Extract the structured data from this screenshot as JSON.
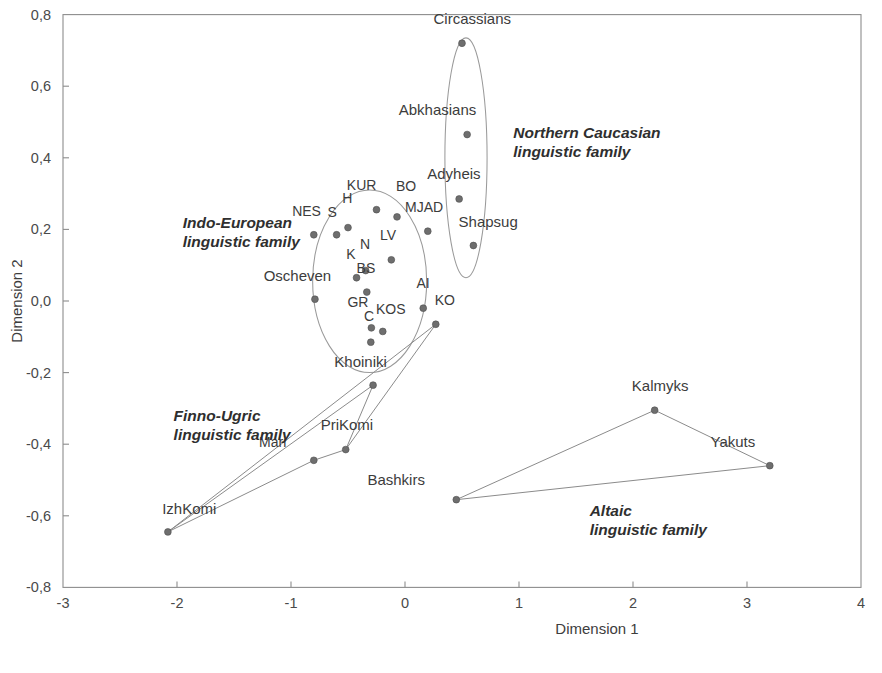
{
  "chart_data": {
    "type": "scatter",
    "title": "",
    "xlabel": "Dimension 1",
    "ylabel": "Dimension 2",
    "xlim": [
      -3,
      4
    ],
    "ylim": [
      -0.8,
      0.8
    ],
    "xticks": [
      "-3",
      "-2",
      "-1",
      "0",
      "1",
      "2",
      "3",
      "4"
    ],
    "xtick_values": [
      -3,
      -2,
      -1,
      0,
      1,
      2,
      3,
      4
    ],
    "yticks": [
      "0,8",
      "0,6",
      "0,4",
      "0,2",
      "0,0",
      "-0,2",
      "-0,4",
      "-0,6",
      "-0,8"
    ],
    "ytick_values": [
      0.8,
      0.6,
      0.4,
      0.2,
      0.0,
      -0.2,
      -0.4,
      -0.6,
      -0.8
    ],
    "grid": false,
    "legend": "none",
    "decimal_separator": "comma",
    "points": [
      {
        "label": "Circassians",
        "x": 0.5,
        "y": 0.72,
        "lx": -0.25,
        "ly": 0.055,
        "anchor": "start"
      },
      {
        "label": "Abkhasians",
        "x": 0.545,
        "y": 0.465,
        "lx": -0.6,
        "ly": 0.055,
        "anchor": "start"
      },
      {
        "label": "Adyheis",
        "x": 0.475,
        "y": 0.285,
        "lx": -0.28,
        "ly": 0.055,
        "anchor": "start"
      },
      {
        "label": "Shapsug",
        "x": 0.6,
        "y": 0.155,
        "lx": -0.13,
        "ly": 0.052,
        "anchor": "start"
      },
      {
        "label": "KUR",
        "x": -0.25,
        "y": 0.255,
        "lx": -0.26,
        "ly": 0.055,
        "anchor": "start"
      },
      {
        "label": "BO",
        "x": -0.07,
        "y": 0.235,
        "lx": -0.01,
        "ly": 0.072,
        "anchor": "start"
      },
      {
        "label": "MJAD",
        "x": 0.2,
        "y": 0.195,
        "lx": -0.2,
        "ly": 0.055,
        "anchor": "start"
      },
      {
        "label": "NES",
        "x": -0.8,
        "y": 0.185,
        "lx": -0.19,
        "ly": 0.052,
        "anchor": "start"
      },
      {
        "label": "S",
        "x": -0.6,
        "y": 0.185,
        "lx": -0.08,
        "ly": 0.05,
        "anchor": "start"
      },
      {
        "label": "H",
        "x": -0.5,
        "y": 0.205,
        "lx": -0.05,
        "ly": 0.068,
        "anchor": "start"
      },
      {
        "label": "LV",
        "x": -0.12,
        "y": 0.115,
        "lx": -0.1,
        "ly": 0.055,
        "anchor": "start"
      },
      {
        "label": "N",
        "x": -0.345,
        "y": 0.085,
        "lx": -0.05,
        "ly": 0.06,
        "anchor": "start"
      },
      {
        "label": "K",
        "x": -0.425,
        "y": 0.065,
        "lx": -0.09,
        "ly": 0.052,
        "anchor": "start"
      },
      {
        "label": "BS",
        "x": -0.335,
        "y": 0.025,
        "lx": -0.09,
        "ly": 0.052,
        "anchor": "start"
      },
      {
        "label": "Oscheven",
        "x": -0.79,
        "y": 0.005,
        "lx": -0.45,
        "ly": 0.05,
        "anchor": "start"
      },
      {
        "label": "AI",
        "x": 0.16,
        "y": -0.02,
        "lx": -0.06,
        "ly": 0.055,
        "anchor": "start"
      },
      {
        "label": "KO",
        "x": 0.27,
        "y": -0.065,
        "lx": -0.01,
        "ly": 0.055,
        "anchor": "start"
      },
      {
        "label": "KOS",
        "x": -0.195,
        "y": -0.085,
        "lx": -0.06,
        "ly": 0.048,
        "anchor": "start"
      },
      {
        "label": "GR",
        "x": -0.295,
        "y": -0.075,
        "lx": -0.21,
        "ly": 0.058,
        "anchor": "start"
      },
      {
        "label": "C",
        "x": -0.3,
        "y": -0.115,
        "lx": -0.06,
        "ly": 0.058,
        "anchor": "start"
      },
      {
        "label": "Khoiniki",
        "x": -0.28,
        "y": -0.235,
        "lx": -0.34,
        "ly": 0.05,
        "anchor": "start"
      },
      {
        "label": "PriKomi",
        "x": -0.52,
        "y": -0.415,
        "lx": -0.22,
        "ly": 0.055,
        "anchor": "start"
      },
      {
        "label": "Mari",
        "x": -0.8,
        "y": -0.445,
        "lx": -0.48,
        "ly": 0.037,
        "anchor": "start"
      },
      {
        "label": "IzhKomi",
        "x": -2.08,
        "y": -0.645,
        "lx": -0.05,
        "ly": 0.05,
        "anchor": "start"
      },
      {
        "label": "Kalmyks",
        "x": 2.19,
        "y": -0.305,
        "lx": -0.2,
        "ly": 0.055,
        "anchor": "start"
      },
      {
        "label": "Yakuts",
        "x": 3.2,
        "y": -0.46,
        "lx": -0.52,
        "ly": 0.052,
        "anchor": "start"
      },
      {
        "label": "Bashkirs",
        "x": 0.45,
        "y": -0.555,
        "lx": -0.78,
        "ly": 0.04,
        "anchor": "start"
      }
    ],
    "clusters": [
      {
        "name": "Northern Caucasian linguistic family",
        "label_lines": [
          "Northern Caucasian",
          "linguistic family"
        ],
        "label_x": 0.95,
        "label_y": 0.455,
        "shape": "ellipse",
        "cx": 0.535,
        "cy": 0.4,
        "rx": 0.185,
        "ry": 0.335
      },
      {
        "name": "Indo-European linguistic family",
        "label_lines": [
          "Indo-European",
          "linguistic family"
        ],
        "label_x": -1.95,
        "label_y": 0.205,
        "shape": "ellipse",
        "cx": -0.31,
        "cy": 0.055,
        "rx": 0.5,
        "ry": 0.255
      },
      {
        "name": "Finno-Ugric linguistic family",
        "label_lines": [
          "Finno-Ugric",
          "linguistic family"
        ],
        "label_x": -2.03,
        "label_y": -0.335,
        "shape": "polyline",
        "vertices": [
          {
            "x": -0.28,
            "y": -0.235
          },
          {
            "x": -2.08,
            "y": -0.645
          },
          {
            "x": -0.8,
            "y": -0.445
          },
          {
            "x": -0.52,
            "y": -0.415
          },
          {
            "x": -0.28,
            "y": -0.235
          }
        ]
      },
      {
        "name": "Altaic linguistic family",
        "label_lines": [
          "Altaic",
          "linguistic family"
        ],
        "label_x": 1.62,
        "label_y": -0.6,
        "shape": "polygon",
        "vertices": [
          {
            "x": 0.45,
            "y": -0.555
          },
          {
            "x": 2.19,
            "y": -0.305
          },
          {
            "x": 3.2,
            "y": -0.46
          },
          {
            "x": 0.45,
            "y": -0.555
          }
        ]
      }
    ],
    "extra_connectors": [
      {
        "name": "khoiniki-to-ko",
        "vertices": [
          {
            "x": -2.08,
            "y": -0.645
          },
          {
            "x": 0.27,
            "y": -0.065
          }
        ]
      },
      {
        "name": "prikomi-to-ko",
        "vertices": [
          {
            "x": -0.52,
            "y": -0.415
          },
          {
            "x": 0.27,
            "y": -0.065
          }
        ]
      }
    ],
    "colors": {
      "point": "#6e6e6e",
      "axis": "#8d8d8d",
      "text": "#3a3a3a",
      "ellipse": "#9a9a9a",
      "background": "#ffffff"
    }
  }
}
